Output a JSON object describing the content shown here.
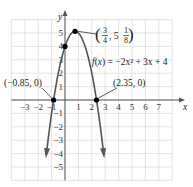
{
  "chart_data": {
    "type": "line",
    "title": "",
    "function": "f(x) = -2x^2 + 3x + 4",
    "function_label": {
      "f": "f",
      "x": "x",
      "rhs": " = −2x² + 3x + 4"
    },
    "xlabel": "x",
    "ylabel": "y",
    "xlim": [
      -4,
      8
    ],
    "ylim": [
      -6,
      6
    ],
    "grid": true,
    "x_ticks": [
      "−3",
      "−2",
      "−1",
      "1",
      "2",
      "3",
      "4",
      "5",
      "6",
      "7"
    ],
    "y_ticks": [
      "5",
      "4",
      "3",
      "2",
      "1",
      "−1",
      "−2",
      "−3",
      "−4",
      "−5"
    ],
    "points": [
      {
        "name": "vertex",
        "x": 0.75,
        "y": 5.125,
        "label": "(3/4, 5 1/8)"
      },
      {
        "name": "y-intercept",
        "x": 0,
        "y": 4,
        "label": ""
      },
      {
        "name": "left-root",
        "x": -0.85,
        "y": 0,
        "label": "(−0.85, 0)"
      },
      {
        "name": "right-root",
        "x": 2.35,
        "y": 0,
        "label": "(2.35, 0)"
      }
    ],
    "annotations": {
      "left_root": "(−0.85, 0)",
      "right_root": "(2.35, 0)",
      "vertex_open": "(",
      "vertex_num": "3",
      "vertex_den": "4",
      "vertex_mid": ", 5",
      "vertex_fnum": "1",
      "vertex_fden": "8",
      "vertex_close": ")"
    },
    "colors": {
      "curve": "#555555",
      "grid": "#d9d9d9",
      "axis": "#555555",
      "point": "#000000"
    }
  }
}
